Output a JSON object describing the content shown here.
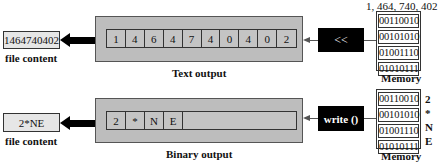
{
  "text_section": {
    "file_content": "1464740402",
    "file_label": "file content",
    "output_label": "Text output",
    "cells": [
      "1",
      "4",
      "6",
      "4",
      "7",
      "4",
      "0",
      "4",
      "0",
      "2"
    ],
    "operator": "<<",
    "memory_value_label": "1, 464, 740, 402",
    "memory_bytes": [
      "00110010",
      "00101010",
      "01001110",
      "01010111"
    ],
    "memory_label": "Memory"
  },
  "binary_section": {
    "file_content": "2*NE",
    "file_label": "file content",
    "output_label": "Binary output",
    "cells": [
      "2",
      "*",
      "N",
      "E"
    ],
    "operator": "write ()",
    "memory_bytes": [
      "00110010",
      "00101010",
      "01001110",
      "01010111"
    ],
    "memory_chars": [
      "2",
      "*",
      "N",
      "E"
    ],
    "memory_label": "Memory"
  }
}
